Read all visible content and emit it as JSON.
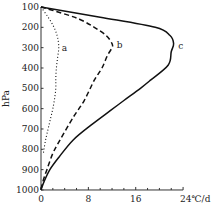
{
  "chart_data": {
    "type": "line",
    "title": "",
    "xlabel": "°C/d",
    "ylabel": "hPa",
    "xlim": [
      0,
      24
    ],
    "ylim": [
      1000,
      100
    ],
    "y_inverted": true,
    "x_ticks": [
      0,
      8,
      16,
      24
    ],
    "x_tick_labels": [
      "0",
      "8",
      "16",
      "24℃/d"
    ],
    "x_minor_step": 2,
    "y_ticks": [
      100,
      200,
      300,
      400,
      500,
      600,
      700,
      800,
      900,
      1000
    ],
    "y_tick_labels": [
      "100",
      "200",
      "300",
      "400",
      "500",
      "600",
      "700",
      "800",
      "900",
      "1000"
    ],
    "grid": false,
    "legend": "inline curve labels",
    "series": [
      {
        "name": "a",
        "style": "dotted",
        "points": [
          [
            0,
            100
          ],
          [
            1.2,
            150
          ],
          [
            2.2,
            200
          ],
          [
            2.8,
            250
          ],
          [
            3,
            300
          ],
          [
            2.8,
            350
          ],
          [
            2.6,
            400
          ],
          [
            2.5,
            450
          ],
          [
            2.5,
            500
          ],
          [
            2.3,
            550
          ],
          [
            2,
            600
          ],
          [
            1.6,
            650
          ],
          [
            1.2,
            700
          ],
          [
            0.8,
            750
          ],
          [
            0.5,
            800
          ],
          [
            0.4,
            820
          ]
        ]
      },
      {
        "name": "b",
        "style": "dashed",
        "points": [
          [
            0,
            100
          ],
          [
            3.5,
            130
          ],
          [
            6.5,
            160
          ],
          [
            9,
            200
          ],
          [
            11,
            240
          ],
          [
            12,
            280
          ],
          [
            12,
            300
          ],
          [
            11.2,
            340
          ],
          [
            10.3,
            400
          ],
          [
            9,
            460
          ],
          [
            7.3,
            560
          ],
          [
            5.5,
            640
          ],
          [
            3.2,
            755
          ],
          [
            2,
            820
          ],
          [
            1,
            900
          ],
          [
            0.3,
            960
          ],
          [
            0,
            1000
          ]
        ]
      },
      {
        "name": "c",
        "style": "solid",
        "points": [
          [
            0,
            100
          ],
          [
            10,
            150
          ],
          [
            19.3,
            200
          ],
          [
            21.8,
            240
          ],
          [
            22.4,
            280
          ],
          [
            22,
            320
          ],
          [
            21.5,
            385
          ],
          [
            18.5,
            460
          ],
          [
            16.8,
            500
          ],
          [
            14,
            560
          ],
          [
            11.7,
            610
          ],
          [
            8.5,
            680
          ],
          [
            5.4,
            755
          ],
          [
            3,
            840
          ],
          [
            1.5,
            900
          ],
          [
            0.5,
            960
          ],
          [
            0,
            1000
          ]
        ]
      }
    ],
    "annotations": [
      {
        "text": "a",
        "near_x": 3.5,
        "near_y": 300
      },
      {
        "text": "b",
        "near_x": 12.8,
        "near_y": 285
      },
      {
        "text": "c",
        "near_x": 23.2,
        "near_y": 290
      }
    ]
  }
}
